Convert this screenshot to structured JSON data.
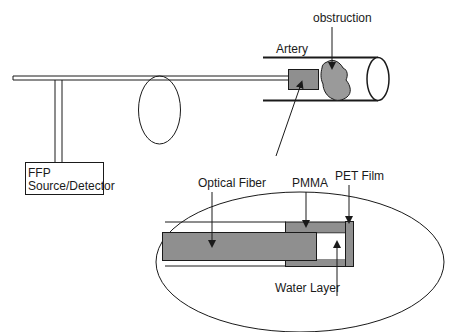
{
  "diagram": {
    "type": "schematic",
    "colors": {
      "line": "#1a1a1a",
      "fill_gray": "#8f8f8f",
      "obstruction_fill": "#9a9a9a",
      "background": "#ffffff"
    },
    "labels": {
      "obstruction": "obstruction",
      "artery": "Artery",
      "ffp_line1": "FFP",
      "ffp_line2": "Source/Detector",
      "optical_fiber": "Optical Fiber",
      "pmma": "PMMA",
      "pet_film": "PET Film",
      "water_layer": "Water Layer"
    },
    "components": [
      {
        "name": "FFP Source/Detector",
        "shape": "rectangle"
      },
      {
        "name": "Fiber coil loop",
        "shape": "ellipse"
      },
      {
        "name": "Artery",
        "shape": "cylinder"
      },
      {
        "name": "Probe tip",
        "shape": "rectangle"
      },
      {
        "name": "Obstruction",
        "shape": "blob"
      },
      {
        "name": "Magnified probe detail",
        "shape": "ellipse",
        "parts": [
          "Optical Fiber",
          "PMMA",
          "PET Film",
          "Water Layer"
        ]
      }
    ]
  }
}
